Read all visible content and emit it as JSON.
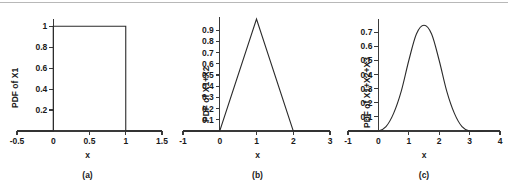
{
  "figure": {
    "background_color": "#ffffff",
    "line_color": "#2b2b2b",
    "axis_color": "#3a3a3a",
    "top_rule_color": "#b8b8b8"
  },
  "panels": [
    {
      "id": "a",
      "caption": "(a)",
      "xlabel": "x",
      "ylabel": "PDF of X1",
      "xticks": [
        "-0.5",
        "0",
        "0.5",
        "1",
        "1.5"
      ],
      "xtick_values": [
        -0.5,
        0,
        0.5,
        1,
        1.5
      ],
      "yticks": [
        "0.2",
        "0.4",
        "0.6",
        "0.8",
        "1"
      ],
      "ytick_values": [
        0.2,
        0.4,
        0.6,
        0.8,
        1
      ]
    },
    {
      "id": "b",
      "caption": "(b)",
      "xlabel": "x",
      "ylabel": "PDF of X1+X2",
      "xticks": [
        "-1",
        "0",
        "1",
        "2",
        "3"
      ],
      "xtick_values": [
        -1,
        0,
        1,
        2,
        3
      ],
      "yticks": [
        "0.1",
        "0.2",
        "0.3",
        "0.4",
        "0.5",
        "0.6",
        "0.7",
        "0.8",
        "0.9"
      ],
      "ytick_values": [
        0.1,
        0.2,
        0.3,
        0.4,
        0.5,
        0.6,
        0.7,
        0.8,
        0.9
      ]
    },
    {
      "id": "c",
      "caption": "(c)",
      "xlabel": "x",
      "ylabel": "PDF of X1+X2+X3",
      "xticks": [
        "-1",
        "0",
        "1",
        "2",
        "3",
        "4"
      ],
      "xtick_values": [
        -1,
        0,
        1,
        2,
        3,
        4
      ],
      "yticks": [
        "0.1",
        "0.2",
        "0.3",
        "0.4",
        "0.5",
        "0.6",
        "0.7"
      ],
      "ytick_values": [
        0.1,
        0.2,
        0.3,
        0.4,
        0.5,
        0.6,
        0.7
      ]
    }
  ],
  "chart_data": [
    {
      "type": "line",
      "panel": "a",
      "title": "(a)",
      "xlabel": "x",
      "ylabel": "PDF of X1",
      "xlim": [
        -0.5,
        1.5
      ],
      "ylim": [
        0,
        1.05
      ],
      "grid": false,
      "legend": "none",
      "description": "Uniform(0,1) probability density function: rectangle of height 1 on [0,1], zero elsewhere.",
      "series": [
        {
          "name": "PDF of X1",
          "x": [
            -0.5,
            0,
            0,
            1,
            1,
            1.5
          ],
          "y": [
            0,
            0,
            1,
            1,
            0,
            0
          ]
        }
      ]
    },
    {
      "type": "line",
      "panel": "b",
      "title": "(b)",
      "xlabel": "x",
      "ylabel": "PDF of X1+X2",
      "xlim": [
        -1,
        3
      ],
      "ylim": [
        0,
        1.0
      ],
      "grid": false,
      "legend": "none",
      "description": "Triangular (Irwin-Hall n=2) probability density function: peaks at x=1 with value 1.0, linear on [0,1] and [1,2].",
      "series": [
        {
          "name": "PDF of X1+X2",
          "x": [
            -1,
            0,
            1,
            2,
            3
          ],
          "y": [
            0,
            0,
            1.0,
            0,
            0
          ]
        }
      ]
    },
    {
      "type": "line",
      "panel": "c",
      "title": "(c)",
      "xlabel": "x",
      "ylabel": "PDF of X1+X2+X3",
      "xlim": [
        -1,
        4
      ],
      "ylim": [
        0,
        0.78
      ],
      "grid": false,
      "legend": "none",
      "description": "Irwin-Hall n=3 probability density function: bell-shaped, peaks at x=1.5 with value 0.75, support [0,3].",
      "series": [
        {
          "name": "PDF of X1+X2+X3",
          "x": [
            -1,
            -0.5,
            0,
            0.25,
            0.5,
            0.75,
            1,
            1.25,
            1.5,
            1.75,
            2,
            2.25,
            2.5,
            2.75,
            3,
            3.5,
            4
          ],
          "y": [
            0,
            0,
            0,
            0.031,
            0.125,
            0.281,
            0.5,
            0.688,
            0.75,
            0.688,
            0.5,
            0.281,
            0.125,
            0.031,
            0,
            0,
            0
          ]
        }
      ]
    }
  ]
}
